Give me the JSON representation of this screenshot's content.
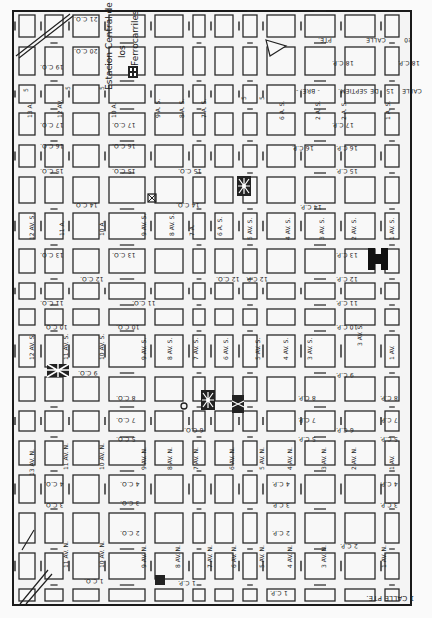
{
  "map": {
    "title": "Estacion Central de los Ferrocarriles",
    "station_label_lines": [
      "Estacion Central de",
      "los",
      "Ferrocarriles"
    ],
    "orientation": "rotated 180 degrees",
    "grid": {
      "columns_x": [
        14,
        40,
        68,
        104,
        150,
        188,
        210,
        238,
        262,
        300,
        340,
        380,
        404,
        416
      ],
      "rows_y": [
        10,
        42,
        80,
        108,
        140,
        172,
        208,
        244,
        278,
        304,
        330,
        372,
        406,
        436,
        470,
        508,
        548,
        584,
        606
      ]
    },
    "calles_poniente": [
      "21 C.O.",
      "20 C.O.",
      "19 C.O.",
      "17 C.O.",
      "16 C.O.",
      "15 C.O.",
      "14 C.O.",
      "13 C.O.",
      "12 C.O.",
      "11 C.O.",
      "10 C.O.",
      "9 C.O.",
      "8 C.O.",
      "7 C.O.",
      "5 C.O.",
      "4 C.O.",
      "3 C.O."
    ],
    "calles_oriente": [
      "19 C.P.",
      "17 C.P.",
      "16 C.P.",
      "15 C.P.",
      "14 C.P.",
      "13 C.P.",
      "12 C.P.",
      "11 C.P.",
      "10 C.P.",
      "9 C.P.",
      "8 C.P.",
      "7 C.P.",
      "6 C.P.",
      "5 C.P.",
      "4 C.P.",
      "3 C.P.",
      "2 C.P.",
      "1 C.P."
    ],
    "avenidas_sur": [
      "13 A.",
      "12 AV.",
      "11 AV. S.",
      "10 AV. S.",
      "9 AV. S.",
      "8 AV. S.",
      "7 AV. S.",
      "6 AV. S.",
      "5 AV. S.",
      "4 AV. S.",
      "3 AV. S.",
      "2 AV. S.",
      "1 AV. S."
    ],
    "avenidas_norte": [
      "13 AV. N.",
      "12 AV. N.",
      "11 AV. N.",
      "10 AV. N.",
      "9 AV. N.",
      "8 AV. N.",
      "7 AV. N.",
      "6 AV. N.",
      "5 AV. N.",
      "4 AV. N.",
      "3 AV. N.",
      "2 AV. N.",
      "1 AV. N."
    ],
    "top_labels": [
      "PTE.",
      "CALLE",
      "20",
      "18 C.P.",
      "SEPTIEM.",
      "DE",
      "15",
      "CALLE"
    ],
    "bottom_label": "1 CALLE PTE.",
    "labels": [
      {
        "text": "21 C.O.",
        "x": 74,
        "y": 16
      },
      {
        "text": "20 C.O.",
        "x": 74,
        "y": 48
      },
      {
        "text": "19 C.O.",
        "x": 40,
        "y": 64
      },
      {
        "text": "17 C.O.",
        "x": 40,
        "y": 122
      },
      {
        "text": "17 C.O.",
        "x": 112,
        "y": 122
      },
      {
        "text": "16 C.O.",
        "x": 40,
        "y": 143
      },
      {
        "text": "16 C.O.",
        "x": 112,
        "y": 143
      },
      {
        "text": "15 C.O.",
        "x": 40,
        "y": 168
      },
      {
        "text": "15 C.O.",
        "x": 112,
        "y": 168
      },
      {
        "text": "15 C.O.",
        "x": 178,
        "y": 168
      },
      {
        "text": "14 C.O.",
        "x": 74,
        "y": 202
      },
      {
        "text": "14 C.O.",
        "x": 176,
        "y": 202
      },
      {
        "text": "13 C.O.",
        "x": 40,
        "y": 252
      },
      {
        "text": "13 C.O.",
        "x": 112,
        "y": 252
      },
      {
        "text": "12 C.O.",
        "x": 80,
        "y": 276
      },
      {
        "text": "12 C.O.",
        "x": 216,
        "y": 276
      },
      {
        "text": "11 C.O.",
        "x": 40,
        "y": 300
      },
      {
        "text": "11 C.O.",
        "x": 132,
        "y": 300
      },
      {
        "text": "10 C.O.",
        "x": 44,
        "y": 324
      },
      {
        "text": "10 C.O.",
        "x": 116,
        "y": 324
      },
      {
        "text": "9 C.O.",
        "x": 78,
        "y": 370
      },
      {
        "text": "8 C.O.",
        "x": 116,
        "y": 395
      },
      {
        "text": "7 C.O.",
        "x": 116,
        "y": 417
      },
      {
        "text": "6 C.O.",
        "x": 184,
        "y": 427
      },
      {
        "text": "5 C.O.",
        "x": 116,
        "y": 436
      },
      {
        "text": "4 C.O.",
        "x": 44,
        "y": 481
      },
      {
        "text": "4 C.O.",
        "x": 120,
        "y": 481
      },
      {
        "text": "3 C.O.",
        "x": 44,
        "y": 502
      },
      {
        "text": "3 C.O.",
        "x": 120,
        "y": 500
      },
      {
        "text": "2 C.O.",
        "x": 120,
        "y": 530
      },
      {
        "text": "1 C.O.",
        "x": 84,
        "y": 578
      },
      {
        "text": "1 C.P.",
        "x": 178,
        "y": 580
      },
      {
        "text": "1 C.P.",
        "x": 270,
        "y": 590
      },
      {
        "text": "18 C.P.",
        "x": 332,
        "y": 60
      },
      {
        "text": "18 C.P.",
        "x": 398,
        "y": 60
      },
      {
        "text": "17 C.P.",
        "x": 332,
        "y": 122
      },
      {
        "text": "16 C.P.",
        "x": 336,
        "y": 145
      },
      {
        "text": "16 C.P.",
        "x": 292,
        "y": 145
      },
      {
        "text": "15 C.P.",
        "x": 336,
        "y": 168
      },
      {
        "text": "14 C.P.",
        "x": 300,
        "y": 204
      },
      {
        "text": "13 C.P.",
        "x": 336,
        "y": 252
      },
      {
        "text": "12 C.P.",
        "x": 336,
        "y": 276
      },
      {
        "text": "12 C.P.",
        "x": 246,
        "y": 276
      },
      {
        "text": "11 C.P.",
        "x": 336,
        "y": 300
      },
      {
        "text": "10 C.P.",
        "x": 336,
        "y": 324
      },
      {
        "text": "9 C.P.",
        "x": 336,
        "y": 372
      },
      {
        "text": "8 C.P.",
        "x": 298,
        "y": 395
      },
      {
        "text": "8 C.P.",
        "x": 380,
        "y": 395
      },
      {
        "text": "7 C.P.",
        "x": 298,
        "y": 417
      },
      {
        "text": "7 C.P.",
        "x": 380,
        "y": 417
      },
      {
        "text": "6 C.P.",
        "x": 336,
        "y": 427
      },
      {
        "text": "5 C.P.",
        "x": 298,
        "y": 436
      },
      {
        "text": "5 C.P.",
        "x": 380,
        "y": 436
      },
      {
        "text": "4 C.P.",
        "x": 272,
        "y": 481
      },
      {
        "text": "4 C.P.",
        "x": 380,
        "y": 481
      },
      {
        "text": "3 C.P.",
        "x": 272,
        "y": 502
      },
      {
        "text": "3 C.P.",
        "x": 380,
        "y": 502
      },
      {
        "text": "2 C.P.",
        "x": 272,
        "y": 530
      },
      {
        "text": "2 C.P.",
        "x": 340,
        "y": 543
      }
    ],
    "vertical_labels": [
      {
        "text": "13 A.",
        "x": 26,
        "y": 118
      },
      {
        "text": "12 AV.",
        "x": 56,
        "y": 118
      },
      {
        "text": "10 A.",
        "x": 110,
        "y": 118
      },
      {
        "text": "9 A. S.",
        "x": 154,
        "y": 118
      },
      {
        "text": "8 A. S.",
        "x": 178,
        "y": 118
      },
      {
        "text": "7 A. S.",
        "x": 200,
        "y": 118
      },
      {
        "text": "5",
        "x": 22,
        "y": 92
      },
      {
        "text": "5",
        "x": 64,
        "y": 90
      },
      {
        "text": "5",
        "x": 98,
        "y": 90
      },
      {
        "text": "5",
        "x": 240,
        "y": 100
      },
      {
        "text": "5",
        "x": 258,
        "y": 100
      },
      {
        "text": "6 A. S.",
        "x": 278,
        "y": 120
      },
      {
        "text": "2 A. S.",
        "x": 314,
        "y": 120
      },
      {
        "text": "2 A. S.",
        "x": 340,
        "y": 120
      },
      {
        "text": "1 A. S.",
        "x": 384,
        "y": 120
      },
      {
        "text": "12 AV. S.",
        "x": 28,
        "y": 240
      },
      {
        "text": "11 A.",
        "x": 58,
        "y": 236
      },
      {
        "text": "10 A.",
        "x": 98,
        "y": 236
      },
      {
        "text": "9 AV. S.",
        "x": 140,
        "y": 236
      },
      {
        "text": "8 AV. S.",
        "x": 168,
        "y": 236
      },
      {
        "text": "7 A.",
        "x": 188,
        "y": 236
      },
      {
        "text": "6 A. S.",
        "x": 216,
        "y": 236
      },
      {
        "text": "5 AV. S.",
        "x": 246,
        "y": 240
      },
      {
        "text": "4 AV. S.",
        "x": 284,
        "y": 240
      },
      {
        "text": "3 AV. S.",
        "x": 318,
        "y": 240
      },
      {
        "text": "2 AV. S.",
        "x": 350,
        "y": 240
      },
      {
        "text": "1 AV. S.",
        "x": 388,
        "y": 240
      },
      {
        "text": "12 AV. S.",
        "x": 28,
        "y": 360
      },
      {
        "text": "11 AV. S.",
        "x": 62,
        "y": 360
      },
      {
        "text": "10 AV. S.",
        "x": 98,
        "y": 360
      },
      {
        "text": "9 AV. S.",
        "x": 140,
        "y": 360
      },
      {
        "text": "8 AV. S.",
        "x": 166,
        "y": 360
      },
      {
        "text": "7 AV. S.",
        "x": 192,
        "y": 360
      },
      {
        "text": "6 AV. S.",
        "x": 222,
        "y": 360
      },
      {
        "text": "5 AV. S.",
        "x": 254,
        "y": 360
      },
      {
        "text": "4 AV. S.",
        "x": 282,
        "y": 360
      },
      {
        "text": "3 AV. S.",
        "x": 306,
        "y": 360
      },
      {
        "text": "3 AV. S.",
        "x": 356,
        "y": 346
      },
      {
        "text": "1 AV.",
        "x": 388,
        "y": 360
      },
      {
        "text": "13 AV. N.",
        "x": 28,
        "y": 476
      },
      {
        "text": "11 AV. N.",
        "x": 62,
        "y": 470
      },
      {
        "text": "10 AV. N.",
        "x": 98,
        "y": 470
      },
      {
        "text": "9 AV. N.",
        "x": 140,
        "y": 470
      },
      {
        "text": "8 AV. N.",
        "x": 166,
        "y": 470
      },
      {
        "text": "7 AV. N.",
        "x": 192,
        "y": 470
      },
      {
        "text": "6 AV. N.",
        "x": 228,
        "y": 470
      },
      {
        "text": "5 AV. N.",
        "x": 258,
        "y": 470
      },
      {
        "text": "4 AV. N.",
        "x": 286,
        "y": 470
      },
      {
        "text": "3 AV. N.",
        "x": 320,
        "y": 470
      },
      {
        "text": "2 AV. N.",
        "x": 350,
        "y": 470
      },
      {
        "text": "1 AV.",
        "x": 388,
        "y": 470
      },
      {
        "text": "11 AV. N.",
        "x": 62,
        "y": 568
      },
      {
        "text": "10 AV. N.",
        "x": 98,
        "y": 568
      },
      {
        "text": "9 AV. N.",
        "x": 140,
        "y": 568
      },
      {
        "text": "8 AV. N.",
        "x": 174,
        "y": 568
      },
      {
        "text": "7 AV. N.",
        "x": 206,
        "y": 568
      },
      {
        "text": "6 AV. N.",
        "x": 230,
        "y": 568
      },
      {
        "text": "5 AV. N.",
        "x": 258,
        "y": 568
      },
      {
        "text": "4 AV. N.",
        "x": 286,
        "y": 568
      },
      {
        "text": "3 AV. N.",
        "x": 320,
        "y": 568
      },
      {
        "text": "1 AV. N.",
        "x": 380,
        "y": 568
      }
    ],
    "top_street_labels": [
      {
        "text": "PTE.",
        "x": 318,
        "y": 37
      },
      {
        "text": "CALLE",
        "x": 366,
        "y": 37
      },
      {
        "text": "20",
        "x": 404,
        "y": 37
      },
      {
        "text": "- BRE. -",
        "x": 296,
        "y": 88
      },
      {
        "text": "SEPTIEM.",
        "x": 338,
        "y": 88
      },
      {
        "text": "DE",
        "x": 370,
        "y": 88
      },
      {
        "text": "15",
        "x": 386,
        "y": 88
      },
      {
        "text": "CALLE",
        "x": 402,
        "y": 88
      }
    ],
    "bottom_street_label": {
      "text": "1 CALLE PTE.",
      "x": 376,
      "y": 596
    },
    "landmarks": [
      {
        "name": "railway-station",
        "x": 128,
        "y": 66
      },
      {
        "name": "flag-cross-symbol",
        "x": 58,
        "y": 370
      },
      {
        "name": "star-symbol-north",
        "x": 244,
        "y": 186
      },
      {
        "name": "star-symbol-center",
        "x": 208,
        "y": 400
      },
      {
        "name": "cathedral-symbol",
        "x": 238,
        "y": 404
      },
      {
        "name": "h-building-symbol",
        "x": 378,
        "y": 258
      },
      {
        "name": "square-x-symbol",
        "x": 152,
        "y": 198
      },
      {
        "name": "circle-plaza-symbol",
        "x": 184,
        "y": 406
      },
      {
        "name": "small-black-square",
        "x": 160,
        "y": 580
      }
    ],
    "colors": {
      "ink": "#222222",
      "paper": "#f6f6f6",
      "frame": "#1a1a1a"
    }
  }
}
